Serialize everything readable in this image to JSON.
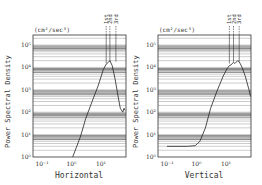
{
  "chart_data": [
    {
      "type": "line",
      "title": "Horizontal",
      "xlabel": "Horizontal",
      "ylabel": "Power Spectral Density",
      "yunit": "(cm²/sec³)",
      "xscale": "log",
      "yscale": "log",
      "xlim": [
        0.07,
        75
      ],
      "ylim": [
        1,
        280000
      ],
      "xticks": [
        "10⁻¹",
        "10⁰",
        "10¹"
      ],
      "yticks": [
        "10⁰",
        "10¹",
        "10²",
        "10³",
        "10⁴",
        "10⁵"
      ],
      "grid": "horizontal minor log gridlines",
      "markers": [
        {
          "label": "1st",
          "x": 15
        },
        {
          "label": "2nd",
          "x": 20
        },
        {
          "label": "3rd",
          "x": 32
        }
      ],
      "x": [
        1.1,
        2,
        3,
        5,
        8,
        12,
        15,
        18,
        20,
        24,
        30,
        38,
        45,
        55,
        60,
        65
      ],
      "values": [
        1,
        8,
        50,
        300,
        1500,
        8000,
        14000,
        17000,
        20000,
        12000,
        3000,
        500,
        150,
        100,
        150,
        120
      ]
    },
    {
      "type": "line",
      "title": "Vertical",
      "xlabel": "Vertical",
      "ylabel": "Power Spectral Density",
      "yunit": "(cm²/sec³)",
      "xscale": "log",
      "yscale": "log",
      "xlim": [
        0.07,
        75
      ],
      "ylim": [
        1,
        280000
      ],
      "xticks": [
        "10⁻¹",
        "10⁰",
        "10¹"
      ],
      "yticks": [
        "10⁰",
        "10¹",
        "10²",
        "10³",
        "10⁴",
        "10⁵"
      ],
      "grid": "horizontal minor log gridlines",
      "markers": [
        {
          "label": "1st",
          "x": 13
        },
        {
          "label": "2nd",
          "x": 18
        },
        {
          "label": "3rd",
          "x": 28
        }
      ],
      "x": [
        0.1,
        0.5,
        0.9,
        1.3,
        2,
        3,
        5,
        8,
        11,
        13,
        15,
        18,
        20,
        25,
        28,
        35,
        45,
        60,
        70
      ],
      "values": [
        3,
        3,
        3.2,
        5,
        20,
        150,
        900,
        4000,
        9000,
        12000,
        13000,
        17000,
        15000,
        20000,
        18000,
        10000,
        4000,
        1000,
        500
      ]
    }
  ],
  "left": {
    "title": "Horizontal",
    "unit": "(cm²/sec³)",
    "ylabel": "Power Spectral Density",
    "markers": [
      "1st",
      "2nd",
      "3rd"
    ],
    "yticks": [
      "10⁵",
      "10⁴",
      "10³",
      "10²",
      "10¹",
      "10⁰"
    ],
    "xticks": [
      "10⁻¹",
      "10⁰",
      "10¹"
    ]
  },
  "right": {
    "title": "Vertical",
    "unit": "(cm²/sec³)",
    "ylabel": "Power Spectral Density",
    "markers": [
      "1st",
      "2nd",
      "3rd"
    ],
    "yticks": [
      "10⁵",
      "10⁴",
      "10³",
      "10²",
      "10¹",
      "10⁰"
    ],
    "xticks": [
      "10⁻¹",
      "10⁰",
      "10¹"
    ]
  }
}
